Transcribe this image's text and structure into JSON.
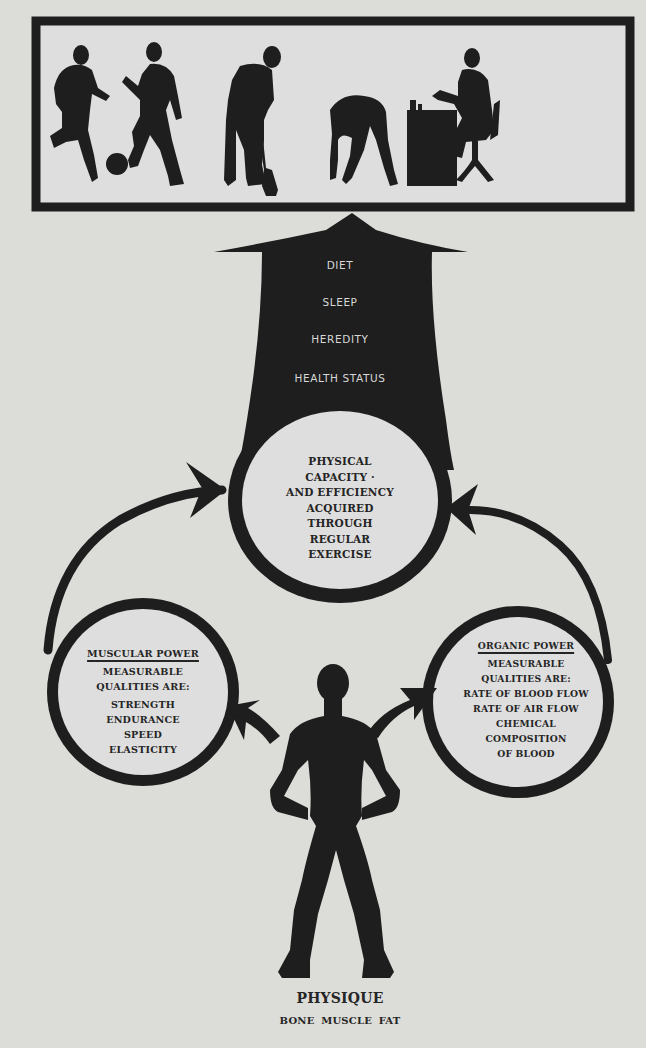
{
  "colors": {
    "paper": "#dcdcd8",
    "ink": "#1e1e1e",
    "reversed_text": "#d8d8d8"
  },
  "activities_panel": {
    "figures": [
      {
        "icon": "soccer-player-running-icon"
      },
      {
        "icon": "soccer-player-kicking-icon"
      },
      {
        "icon": "ball-icon"
      },
      {
        "icon": "man-digging-with-shovel-icon"
      },
      {
        "icon": "man-bending-exercise-icon"
      },
      {
        "icon": "man-at-desk-icon"
      }
    ]
  },
  "arrow": {
    "factors": [
      "DIET",
      "SLEEP",
      "HEREDITY",
      "HEALTH STATUS"
    ]
  },
  "center_circle": {
    "lines": [
      "PHYSICAL",
      "CAPACITY ·",
      "AND EFFICIENCY",
      "ACQUIRED",
      "THROUGH",
      "REGULAR",
      "EXERCISE"
    ]
  },
  "muscular_power": {
    "heading": "MUSCULAR POWER",
    "subheading_lines": [
      "MEASURABLE",
      "QUALITIES ARE:"
    ],
    "qualities": [
      "STRENGTH",
      "ENDURANCE",
      "SPEED",
      "ELASTICITY"
    ]
  },
  "organic_power": {
    "heading": "ORGANIC POWER",
    "subheading_lines": [
      "MEASURABLE",
      "QUALITIES ARE:"
    ],
    "qualities": [
      "RATE OF BLOOD FLOW",
      "RATE OF AIR FLOW",
      "CHEMICAL",
      "COMPOSITION",
      "OF BLOOD"
    ]
  },
  "physique": {
    "title": "PHYSIQUE",
    "components": "BONE MUSCLE FAT"
  }
}
